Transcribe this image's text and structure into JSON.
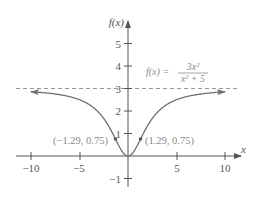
{
  "chart_data": {
    "type": "line",
    "title": "",
    "function": "f(x) = 3x^2 / (x^2 + 5)",
    "xlabel": "x",
    "ylabel": "f(x)",
    "xlim": [
      -11.5,
      11.8
    ],
    "ylim": [
      -1.3,
      6.0
    ],
    "x_ticks": [
      -10,
      -5,
      5,
      10
    ],
    "x_tick_labels": [
      "−10",
      "−5",
      "5",
      "10"
    ],
    "y_ticks": [
      -1,
      1,
      2,
      3,
      4,
      5
    ],
    "y_tick_labels": [
      "−1",
      "1",
      "2",
      "3",
      "4",
      "5"
    ],
    "grid": false,
    "legend": null,
    "series": [
      {
        "name": "f(x) = 3x²/(x² + 5)",
        "x": [
          -10,
          -8,
          -6,
          -4,
          -3,
          -2,
          -1.29,
          -1,
          -0.5,
          0,
          0.5,
          1,
          1.29,
          2,
          3,
          4,
          6,
          8,
          10
        ],
        "y": [
          2.86,
          2.78,
          2.63,
          2.29,
          1.93,
          1.33,
          0.75,
          0.5,
          0.14,
          0,
          0.14,
          0.5,
          0.75,
          1.33,
          1.93,
          2.29,
          2.63,
          2.78,
          2.86
        ],
        "arrows_at_ends": true
      }
    ],
    "asymptote": {
      "type": "horizontal",
      "y": 3,
      "style": "dashed"
    },
    "points": [
      {
        "x": -1.29,
        "y": 0.75,
        "label": "(−1.29, 0.75)"
      },
      {
        "x": 1.29,
        "y": 0.75,
        "label": "(1.29, 0.75)"
      }
    ],
    "annotations": [
      {
        "text": "f(x) = 3x² / (x² + 5)",
        "position": "upper right of y-axis, above asymptote"
      }
    ]
  },
  "labels": {
    "x_axis": "x",
    "y_axis": "f(x)",
    "formula_lhs": "f(x) =",
    "formula_num": "3x²",
    "formula_den": "x² + 5",
    "point_left": "(−1.29, 0.75)",
    "point_right": "(1.29, 0.75)",
    "xt_m10": "−10",
    "xt_m5": "−5",
    "xt_5": "5",
    "xt_10": "10",
    "yt_m1": "−1",
    "yt_1": "1",
    "yt_2": "2",
    "yt_3": "3",
    "yt_4": "4",
    "yt_5": "5"
  },
  "colors": {
    "axis": "#555555",
    "curve": "#707070",
    "asymptote": "#8a8a8a",
    "text": "#555555",
    "annotation": "#8a8a8a"
  }
}
